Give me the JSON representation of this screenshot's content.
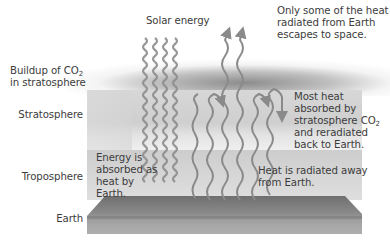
{
  "diagram": {
    "type": "greenhouse-effect-layers",
    "layers": [
      {
        "id": "co2",
        "label_line1": "Buildup of CO",
        "label_sub": "2",
        "label_line2": "in stratosphere"
      },
      {
        "id": "stratosphere",
        "label": "Stratosphere"
      },
      {
        "id": "troposphere",
        "label": "Troposphere"
      },
      {
        "id": "earth",
        "label": "Earth"
      }
    ],
    "annotations": {
      "solar": "Solar energy",
      "escape": [
        "Only some of the heat",
        "radiated from Earth",
        "escapes to space."
      ],
      "reradiated": {
        "line1": "Most heat",
        "line2": "absorbed by",
        "line3_pre": "stratosphere CO",
        "line3_sub": "2",
        "line4": "and reradiated",
        "line5": "back to Earth."
      },
      "absorbed": [
        "Energy is",
        "absorbed as",
        "heat by",
        "Earth."
      ],
      "radiated_away": [
        "Heat is radiated away",
        "from Earth."
      ]
    },
    "colors": {
      "wave": "#8a8a8a",
      "stratosphere": "#d4d4d4",
      "troposphere": "#d2d2d2",
      "earth": "#7c7c7c",
      "text": "#3c3c3c"
    }
  }
}
